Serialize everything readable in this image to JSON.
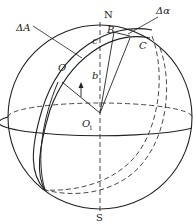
{
  "diagram": {
    "labels": {
      "north": "N",
      "south": "S",
      "delta_A": "ΔA",
      "delta_alpha": "Δα",
      "O": "O",
      "O1_main": "O",
      "O1_sub": "1",
      "B": "B",
      "C": "C",
      "b": "b",
      "c": "c"
    },
    "colors": {
      "stroke": "#222222",
      "background": "#ffffff"
    }
  }
}
